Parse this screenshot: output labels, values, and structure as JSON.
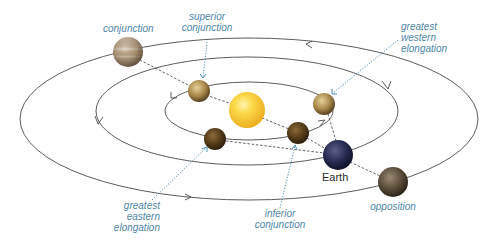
{
  "diagram": {
    "orbits": [
      {
        "name": "inner-orbit",
        "cx": 249,
        "cy": 111,
        "rx": 84,
        "ry": 29
      },
      {
        "name": "earth-orbit",
        "cx": 247,
        "cy": 111,
        "rx": 151,
        "ry": 54
      },
      {
        "name": "outer-orbit",
        "cx": 249,
        "cy": 119,
        "rx": 229,
        "ry": 81
      }
    ],
    "colors": {
      "orbit_line": "#4a4a4a",
      "sight_line": "#3a3a4a",
      "callout": "#4a8fb5",
      "label": "#4e86a8",
      "sun": "#f4c430",
      "earth": "#2a2f55"
    },
    "bodies": [
      {
        "id": "sun",
        "name": "Sun",
        "x": 247,
        "y": 110,
        "r": 18
      },
      {
        "id": "outer-conjunction",
        "name": "outer planet at conjunction",
        "x": 128,
        "y": 52,
        "r": 15
      },
      {
        "id": "superior-conjunction",
        "name": "inner planet at superior conjunction",
        "x": 199,
        "y": 91,
        "r": 11
      },
      {
        "id": "greatest-western-elongation",
        "name": "inner planet at greatest western elongation",
        "x": 324,
        "y": 104,
        "r": 11
      },
      {
        "id": "greatest-eastern-elongation",
        "name": "inner planet at greatest eastern elongation",
        "x": 215,
        "y": 139,
        "r": 11
      },
      {
        "id": "inferior-conjunction",
        "name": "inner planet at inferior conjunction",
        "x": 298,
        "y": 133,
        "r": 11
      },
      {
        "id": "earth",
        "name": "Earth",
        "x": 338,
        "y": 155,
        "r": 15
      },
      {
        "id": "opposition",
        "name": "outer planet at opposition",
        "x": 393,
        "y": 182,
        "r": 15
      }
    ],
    "labels": {
      "conjunction": [
        "conjunction"
      ],
      "superior_conjunction": [
        "superior",
        "conjunction"
      ],
      "greatest_western_elongation": [
        "greatest",
        "western",
        "elongation"
      ],
      "greatest_eastern_elongation": [
        "greatest",
        "eastern",
        "elongation"
      ],
      "inferior_conjunction": [
        "inferior",
        "conjunction"
      ],
      "opposition": [
        "opposition"
      ],
      "earth": "Earth"
    }
  }
}
